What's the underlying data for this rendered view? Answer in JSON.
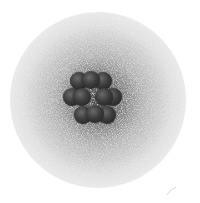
{
  "image": {
    "subject": "atom illustration",
    "description": "Nucleus of clustered spheres surrounded by a diffuse stippled electron cloud",
    "colors": {
      "background": "#ffffff",
      "cloud_core": "#3a3a3a",
      "nucleon": "#3c3c3c"
    },
    "nucleus": {
      "rows": [
        {
          "y": 81,
          "xs": [
            79,
            91,
            103
          ]
        },
        {
          "y": 96,
          "xs": [
            68,
            80,
            99,
            111
          ]
        },
        {
          "y": 111,
          "xs": [
            79,
            91,
            103
          ]
        }
      ]
    }
  }
}
